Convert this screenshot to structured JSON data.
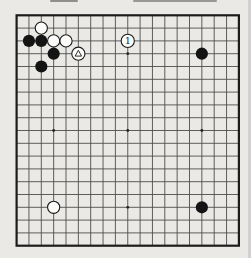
{
  "figure": {
    "kind": "go-board-diagram",
    "board_size": 19,
    "colors": {
      "page_bg": "#eae9e6",
      "grid_line": "#4d4d4d",
      "board_border": "#1c1c1c",
      "black_stone": "#141414",
      "white_stone": "#fbfbfa",
      "stone_outline": "#1a1a1a",
      "star_point": "#222222",
      "label_color": "#111111"
    },
    "star_points": [
      {
        "col": 4,
        "row": 4
      },
      {
        "col": 10,
        "row": 4
      },
      {
        "col": 16,
        "row": 4
      },
      {
        "col": 4,
        "row": 10
      },
      {
        "col": 10,
        "row": 10
      },
      {
        "col": 16,
        "row": 10
      },
      {
        "col": 4,
        "row": 16
      },
      {
        "col": 10,
        "row": 16
      },
      {
        "col": 16,
        "row": 16
      }
    ],
    "stones": [
      {
        "col": 3,
        "row": 2,
        "color": "white"
      },
      {
        "col": 2,
        "row": 3,
        "color": "black"
      },
      {
        "col": 3,
        "row": 3,
        "color": "black"
      },
      {
        "col": 4,
        "row": 3,
        "color": "white"
      },
      {
        "col": 5,
        "row": 3,
        "color": "white"
      },
      {
        "col": 4,
        "row": 4,
        "color": "black"
      },
      {
        "col": 6,
        "row": 4,
        "color": "white",
        "mark": "triangle"
      },
      {
        "col": 3,
        "row": 5,
        "color": "black"
      },
      {
        "col": 10,
        "row": 3,
        "color": "white",
        "label": "1"
      },
      {
        "col": 16,
        "row": 4,
        "color": "black"
      },
      {
        "col": 4,
        "row": 16,
        "color": "white"
      },
      {
        "col": 16,
        "row": 16,
        "color": "black"
      }
    ]
  }
}
